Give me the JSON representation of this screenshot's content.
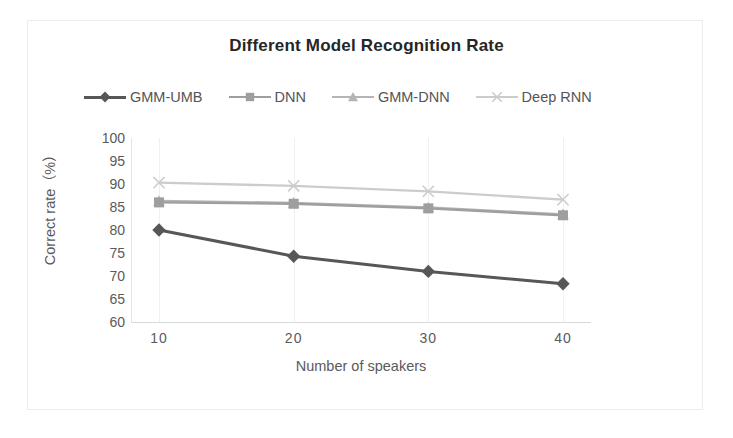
{
  "chart_data": {
    "type": "line",
    "title": "Different Model Recognition Rate",
    "xlabel": "Number of speakers",
    "ylabel": "Correct rate（%）",
    "categories": [
      10,
      20,
      30,
      40
    ],
    "x_tick_labels": [
      "10",
      "20",
      "30",
      "40"
    ],
    "y_tick_labels": [
      "100",
      "95",
      "90",
      "85",
      "80",
      "75",
      "70",
      "65",
      "60"
    ],
    "y_ticks": [
      100,
      95,
      90,
      85,
      80,
      75,
      70,
      65,
      60
    ],
    "ylim": [
      60,
      100
    ],
    "xlim": [
      10,
      40
    ],
    "grid": "vertical-only",
    "legend_position": "top",
    "series": [
      {
        "name": "GMM-UMB",
        "marker": "diamond",
        "color": "#575757",
        "values": [
          80.0,
          74.3,
          71.0,
          68.3
        ]
      },
      {
        "name": "DNN",
        "marker": "square",
        "color": "#9e9e9e",
        "values": [
          86.0,
          85.7,
          84.7,
          83.2
        ]
      },
      {
        "name": "GMM-DNN",
        "marker": "triangle",
        "color": "#b5b5b5",
        "values": [
          86.3,
          85.9,
          84.9,
          83.4
        ]
      },
      {
        "name": "Deep RNN",
        "marker": "x",
        "color": "#cccccc",
        "values": [
          90.3,
          89.6,
          88.4,
          86.6
        ]
      }
    ]
  },
  "legend": {
    "items": [
      {
        "label": "GMM-UMB",
        "icon": "diamond-marker-icon"
      },
      {
        "label": "DNN",
        "icon": "square-marker-icon"
      },
      {
        "label": "GMM-DNN",
        "icon": "triangle-marker-icon"
      },
      {
        "label": "Deep RNN",
        "icon": "x-marker-icon"
      }
    ]
  }
}
